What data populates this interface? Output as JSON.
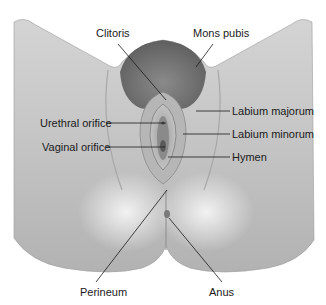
{
  "figure": {
    "colors": {
      "background": "#ffffff",
      "skin_light": "#e9e9e9",
      "skin_mid": "#bdbdbd",
      "skin_dark": "#8f8f8f",
      "hair": "#6e6e6e",
      "line": "#1a1a1a",
      "text": "#1a1a1a"
    },
    "labels": [
      {
        "id": "clitoris",
        "text": "Clitoris",
        "x": 96,
        "y": 30
      },
      {
        "id": "mons-pubis",
        "text": "Mons pubis",
        "x": 193,
        "y": 30
      },
      {
        "id": "labium-majorum",
        "text": "Labium majorum",
        "x": 232,
        "y": 106
      },
      {
        "id": "urethral-orifice",
        "text": "Urethral orifice",
        "x": 40,
        "y": 118
      },
      {
        "id": "labium-minorum",
        "text": "Labium minorum",
        "x": 232,
        "y": 129
      },
      {
        "id": "vaginal-orifice",
        "text": "Vaginal orifice",
        "x": 42,
        "y": 142
      },
      {
        "id": "hymen",
        "text": "Hymen",
        "x": 232,
        "y": 152
      },
      {
        "id": "perineum",
        "text": "Perineum",
        "x": 80,
        "y": 289
      },
      {
        "id": "anus",
        "text": "Anus",
        "x": 209,
        "y": 289
      }
    ]
  }
}
